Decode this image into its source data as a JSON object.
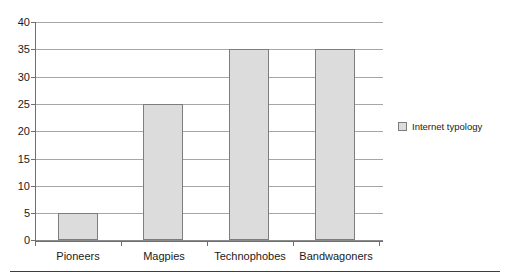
{
  "chart_data": {
    "type": "bar",
    "title": "",
    "xlabel": "",
    "ylabel": "",
    "categories": [
      "Pioneers",
      "Magpies",
      "Technophobes",
      "Bandwagoners"
    ],
    "values": [
      5,
      25,
      35,
      35
    ],
    "series": [
      {
        "name": "Internet typology",
        "values": [
          5,
          25,
          35,
          35
        ]
      }
    ],
    "ylim": [
      0,
      40
    ],
    "ytick_step": 5,
    "yticks": [
      0,
      5,
      10,
      15,
      20,
      25,
      30,
      35,
      40
    ],
    "ytick_labels": [
      "0",
      "5",
      "10",
      "15",
      "20",
      "25",
      "30",
      "35",
      "40"
    ],
    "grid": "horizontal",
    "legend_position": "right",
    "legend_entries": [
      "Internet typology"
    ],
    "colors": {
      "bar_fill": "#dcdcdc",
      "bar_border": "#7d7d7d",
      "gridline": "#a6a6a6",
      "axis": "#6e6e6e",
      "text": "#1a1a1a",
      "background": "#ffffff",
      "rule": "#3d3d3d"
    }
  },
  "legend": {
    "label": "Internet typology"
  }
}
